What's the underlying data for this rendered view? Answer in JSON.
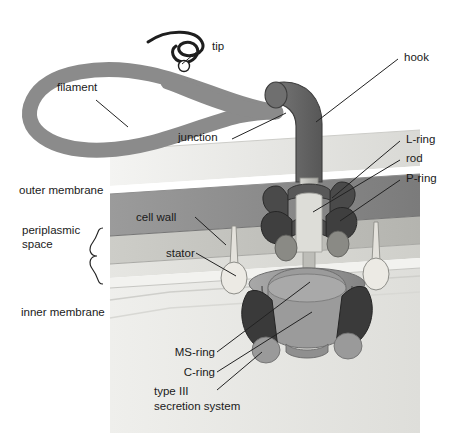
{
  "figure": {
    "type": "labeled anatomical diagram"
  },
  "labels": {
    "tip": "tip",
    "filament": "filament",
    "junction": "junction",
    "hook": "hook",
    "l_ring": "L-ring",
    "rod": "rod",
    "p_ring": "P-ring",
    "outer_membrane": "outer membrane",
    "periplasmic_space_line1": "periplasmic",
    "periplasmic_space_line2": "space",
    "cell_wall": "cell wall",
    "stator": "stator",
    "inner_membrane": "inner membrane",
    "ms_ring": "MS-ring",
    "c_ring": "C-ring",
    "t3ss_line1": "type III",
    "t3ss_line2": "secretion system"
  },
  "colors": {
    "filament": "#8b8b8b",
    "hook": "#6a6a6a",
    "rod": "#c9c9c4",
    "ring_dark": "#3f3f3f",
    "ms_ring": "#9a9a9a",
    "c_ring": "#8f8f8f",
    "stator": "#e4e2dc",
    "outer_membrane": "#ededea",
    "cell_wall": "#8d8d8d",
    "periplasm": "#c3c3be",
    "inner_membrane": "#dcdcd8",
    "cytoplasm": "#e9e9e6",
    "background": "#ffffff",
    "text": "#1a1a1a",
    "leader": "#222222"
  }
}
